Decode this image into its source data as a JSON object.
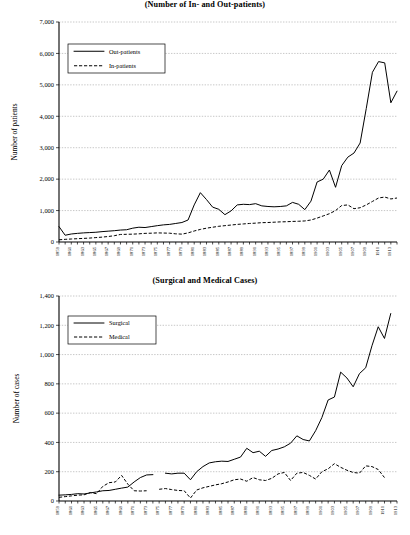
{
  "figures": [
    {
      "title": "(Number of In- and Out-patients)",
      "ylabel": "Number of patients",
      "legend": [
        "Out-patients",
        "In-patients"
      ]
    },
    {
      "title": "(Surgical and Medical Cases)",
      "ylabel": "Number of cases",
      "legend": [
        "Surgical",
        "Medical"
      ]
    }
  ],
  "chart_data": [
    {
      "type": "line",
      "title": "(Number of In- and Out-patients)",
      "xlabel": "",
      "ylabel": "Number of patients",
      "ylim": [
        0,
        7000
      ],
      "ytick_step": 1000,
      "ytick_labels": [
        "0",
        "1,000",
        "2,000",
        "3,000",
        "4,000",
        "5,000",
        "6,000",
        "7,000"
      ],
      "grid": true,
      "legend_position": "upper-left",
      "x": [
        1859,
        1860,
        1861,
        1862,
        1863,
        1864,
        1865,
        1866,
        1867,
        1868,
        1869,
        1870,
        1871,
        1872,
        1873,
        1874,
        1875,
        1876,
        1877,
        1878,
        1879,
        1880,
        1881,
        1882,
        1883,
        1884,
        1885,
        1886,
        1887,
        1888,
        1889,
        1890,
        1891,
        1892,
        1893,
        1894,
        1895,
        1896,
        1897,
        1898,
        1899,
        1900,
        1901,
        1902,
        1903,
        1904,
        1905,
        1906,
        1907,
        1908,
        1909,
        1910,
        1911,
        1912,
        1913,
        1914
      ],
      "xtick_labels": [
        "1859",
        "1861",
        "1863",
        "1865",
        "1867",
        "1869",
        "1871",
        "1873",
        "1875",
        "1877",
        "1879",
        "1881",
        "1883",
        "1885",
        "1887",
        "1889",
        "1891",
        "1893",
        "1895",
        "1897",
        "1899",
        "1901",
        "1903",
        "1905",
        "1907",
        "1909",
        "1911",
        "1913"
      ],
      "series": [
        {
          "name": "Out-patients",
          "style": "solid",
          "values": [
            490,
            215,
            255,
            275,
            290,
            300,
            310,
            330,
            345,
            360,
            380,
            390,
            440,
            470,
            460,
            490,
            520,
            545,
            560,
            590,
            620,
            700,
            1180,
            1570,
            1350,
            1110,
            1040,
            870,
            990,
            1180,
            1200,
            1190,
            1220,
            1150,
            1130,
            1120,
            1130,
            1150,
            1260,
            1200,
            1030,
            1300,
            1910,
            2000,
            2290,
            1740,
            2430,
            2700,
            2830,
            3150,
            4250,
            5400,
            5740,
            5700,
            4430,
            4800,
            4470,
            4400
          ]
        },
        {
          "name": "In-patients",
          "style": "dashed",
          "values": [
            70,
            85,
            95,
            105,
            115,
            125,
            140,
            155,
            175,
            200,
            240,
            245,
            250,
            260,
            275,
            280,
            290,
            285,
            280,
            260,
            250,
            290,
            350,
            400,
            440,
            470,
            500,
            520,
            540,
            560,
            575,
            590,
            600,
            615,
            620,
            630,
            640,
            645,
            655,
            660,
            670,
            700,
            760,
            830,
            900,
            1000,
            1160,
            1180,
            1060,
            1090,
            1180,
            1290,
            1400,
            1430,
            1370,
            1400,
            1450,
            1460,
            1380,
            1290
          ]
        }
      ]
    },
    {
      "type": "line",
      "title": "(Surgical and Medical Cases)",
      "xlabel": "",
      "ylabel": "Number of cases",
      "ylim": [
        0,
        1400
      ],
      "ytick_step": 200,
      "ytick_labels": [
        "0",
        "200",
        "400",
        "600",
        "800",
        "1,000",
        "1,200",
        "1,400"
      ],
      "grid": true,
      "legend_position": "upper-left",
      "x": [
        1859,
        1860,
        1861,
        1862,
        1863,
        1864,
        1865,
        1866,
        1867,
        1868,
        1869,
        1870,
        1871,
        1872,
        1873,
        1874,
        1875,
        1876,
        1877,
        1878,
        1879,
        1880,
        1881,
        1882,
        1883,
        1884,
        1885,
        1886,
        1887,
        1888,
        1889,
        1890,
        1891,
        1892,
        1893,
        1894,
        1895,
        1896,
        1897,
        1898,
        1899,
        1900,
        1901,
        1902,
        1903,
        1904,
        1905,
        1906,
        1907,
        1908,
        1909,
        1910,
        1911,
        1912,
        1913
      ],
      "xtick_labels": [
        "1859",
        "1861",
        "1863",
        "1865",
        "1867",
        "1869",
        "1871",
        "1873",
        "1875",
        "1877",
        "1879",
        "1881",
        "1883",
        "1885",
        "1887",
        "1889",
        "1891",
        "1893",
        "1895",
        "1897",
        "1899",
        "1901",
        "1903",
        "1905",
        "1907",
        "1909",
        "1911",
        "1913"
      ],
      "series": [
        {
          "name": "Surgical",
          "style": "solid",
          "values": [
            40,
            42,
            45,
            50,
            48,
            55,
            62,
            70,
            72,
            80,
            88,
            95,
            130,
            160,
            178,
            180,
            null,
            190,
            185,
            190,
            190,
            145,
            200,
            235,
            260,
            268,
            272,
            270,
            285,
            300,
            360,
            330,
            340,
            305,
            345,
            355,
            370,
            395,
            445,
            420,
            410,
            480,
            570,
            690,
            710,
            880,
            840,
            780,
            870,
            910,
            1060,
            1190,
            1110,
            1280
          ]
        },
        {
          "name": "Medical",
          "style": "dashed",
          "values": [
            25,
            30,
            35,
            40,
            42,
            58,
            50,
            100,
            125,
            130,
            175,
            115,
            70,
            68,
            70,
            null,
            80,
            85,
            78,
            72,
            70,
            20,
            75,
            90,
            100,
            110,
            118,
            130,
            145,
            150,
            135,
            160,
            145,
            140,
            155,
            185,
            195,
            140,
            190,
            195,
            175,
            150,
            200,
            220,
            255,
            230,
            210,
            195,
            190,
            240,
            235,
            215,
            160
          ]
        }
      ]
    }
  ]
}
